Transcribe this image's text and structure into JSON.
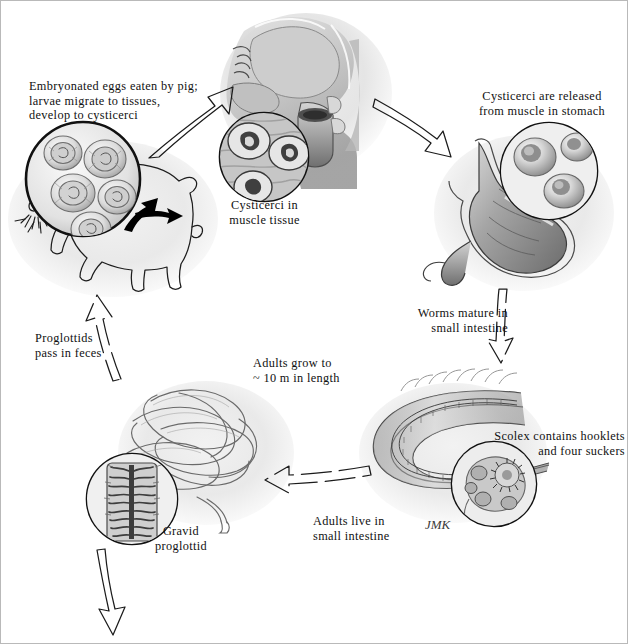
{
  "figure": {
    "signature": "JMK",
    "border_color": "#b9b9b9",
    "background_color": "#ffffff",
    "ink_color": "#111111"
  },
  "labels": {
    "eggs_eaten": "Embryonated eggs eaten by pig;\nlarvae migrate to tissues,\ndevelop to cysticerci",
    "cysticerci_muscle": "Cysticerci in\nmuscle tissue",
    "cysticerci_released": "Cysticerci are released\nfrom muscle in stomach",
    "worms_mature": "Worms mature in\nsmall intestine",
    "scolex": "Scolex contains hooklets\nand four suckers",
    "adults_live": "Adults live in\nsmall intestine",
    "adults_grow": "Adults grow to\n~ 10 m in length",
    "gravid_proglottid": "Gravid\nproglottid",
    "proglottids_feces": "Proglottids\npass in feces"
  },
  "panels": [
    {
      "name": "pig-host",
      "caption": "Embryonated eggs eaten by pig; larvae migrate to tissues, develop to cysticerci"
    },
    {
      "name": "human-head",
      "caption": "Cysticerci in muscle tissue"
    },
    {
      "name": "stomach",
      "caption": "Cysticerci are released from muscle in stomach"
    },
    {
      "name": "small-intestine",
      "caption": "Adults live in small intestine"
    },
    {
      "name": "adult-tapeworm",
      "caption": "Adults grow to ~ 10 m in length"
    }
  ],
  "insets": [
    {
      "name": "eggs-inset",
      "caption": "Embryonated eggs"
    },
    {
      "name": "cysticerci-muscle-inset",
      "caption": "Cysticerci in muscle tissue"
    },
    {
      "name": "cysticerci-stomach-inset",
      "caption": "Cysticerci released in stomach"
    },
    {
      "name": "scolex-inset",
      "caption": "Scolex with hooklets and four suckers"
    },
    {
      "name": "gravid-proglottid-inset",
      "caption": "Gravid proglottid"
    }
  ],
  "arrows": [
    {
      "name": "arrow-pig-to-head",
      "style": "outline",
      "direction": "up-right"
    },
    {
      "name": "arrow-head-to-stomach",
      "style": "outline",
      "direction": "down-right"
    },
    {
      "name": "arrow-stomach-to-intestine",
      "style": "outline-dashed",
      "direction": "down"
    },
    {
      "name": "arrow-intestine-to-worm",
      "style": "outline-dashed",
      "direction": "left"
    },
    {
      "name": "arrow-worm-to-feces",
      "style": "outline-dashed",
      "direction": "up"
    },
    {
      "name": "arrow-proglottid-out",
      "style": "outline",
      "direction": "down"
    },
    {
      "name": "arrow-migration-1",
      "style": "solid-black",
      "direction": "up-right"
    },
    {
      "name": "arrow-migration-2",
      "style": "solid-black",
      "direction": "up-right"
    },
    {
      "name": "arrow-migration-3",
      "style": "solid-black",
      "direction": "right"
    }
  ]
}
